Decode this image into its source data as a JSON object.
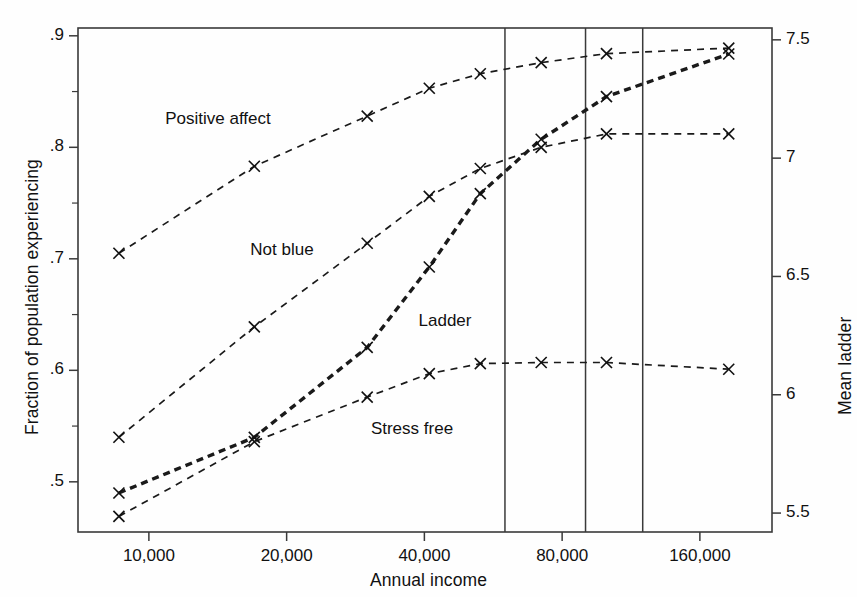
{
  "chart_data": {
    "type": "line",
    "title": "",
    "xlabel": "Annual income",
    "ylabel": "Fraction of population experiencing",
    "ylabel_right": "Mean ladder",
    "xscale": "log2",
    "xlim": [
      7000,
      230000
    ],
    "ylim": [
      0.455,
      0.907
    ],
    "ylim_right": [
      5.42,
      7.55
    ],
    "grid": false,
    "legend": "inline-labels",
    "xticks": [
      {
        "value": 10000,
        "label": "10,000"
      },
      {
        "value": 20000,
        "label": "20,000"
      },
      {
        "value": 40000,
        "label": "40,000"
      },
      {
        "value": 80000,
        "label": "80,000"
      },
      {
        "value": 160000,
        "label": "160,000"
      }
    ],
    "yticks_left": [
      {
        "value": 0.5,
        "label": ".5"
      },
      {
        "value": 0.6,
        "label": ".6"
      },
      {
        "value": 0.7,
        "label": ".7"
      },
      {
        "value": 0.8,
        "label": ".8"
      },
      {
        "value": 0.9,
        "label": ".9"
      }
    ],
    "yticks_right": [
      {
        "value": 5.5,
        "label": "5.5"
      },
      {
        "value": 6.0,
        "label": "6"
      },
      {
        "value": 6.5,
        "label": "6.5"
      },
      {
        "value": 7.0,
        "label": "7"
      },
      {
        "value": 7.5,
        "label": "7.5"
      }
    ],
    "vertical_reference_lines": [
      60000,
      90000,
      120000
    ],
    "x": [
      8600,
      17000,
      30000,
      41000,
      53000,
      72000,
      100000,
      185000
    ],
    "series": [
      {
        "name": "Positive affect",
        "axis": "left",
        "style": "dashed",
        "marker": "x",
        "values": [
          0.705,
          0.783,
          0.828,
          0.853,
          0.866,
          0.876,
          0.884,
          0.889
        ],
        "label_x": 8600,
        "label_position": {
          "left": 218,
          "top": 120
        }
      },
      {
        "name": "Not blue",
        "axis": "left",
        "style": "dashed",
        "marker": "x",
        "values": [
          0.54,
          0.639,
          0.714,
          0.756,
          0.781,
          0.8,
          0.812,
          0.812
        ],
        "label_position": {
          "left": 282,
          "top": 251
        }
      },
      {
        "name": "Ladder",
        "axis": "right",
        "style": "dashed-bold",
        "marker": "x",
        "values_right": [
          5.585,
          5.82,
          6.2,
          6.54,
          6.85,
          7.08,
          7.26,
          7.44
        ],
        "values_left_equivalent": [
          0.489,
          0.539,
          0.619,
          0.691,
          0.737,
          0.793,
          0.841,
          0.889
        ],
        "label_position": {
          "left": 445,
          "top": 322
        }
      },
      {
        "name": "Stress free",
        "axis": "left",
        "style": "dashed",
        "marker": "x",
        "values": [
          0.469,
          0.536,
          0.576,
          0.597,
          0.606,
          0.607,
          0.607,
          0.601
        ],
        "label_position": {
          "left": 412,
          "top": 430
        }
      }
    ]
  },
  "axes": {
    "x_title": "Annual income",
    "y_left_title": "Fraction of population experiencing",
    "y_right_title": "Mean ladder"
  }
}
